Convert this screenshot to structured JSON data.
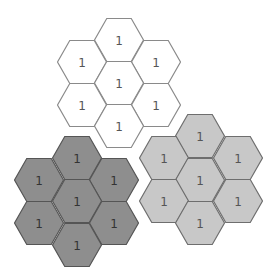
{
  "canvas": {
    "width": 278,
    "height": 278,
    "background": "#ffffff"
  },
  "hex": {
    "side": 24.5,
    "height": 43,
    "orientation": "flat-top"
  },
  "clusters": [
    {
      "name": "white-cluster",
      "fill": "#ffffff",
      "stroke": "#8a8a8a",
      "text_color": "#555555",
      "cells": [
        {
          "position": "top",
          "cx": 119,
          "cy": 40,
          "label": "1"
        },
        {
          "position": "upper-left",
          "cx": 82,
          "cy": 62,
          "label": "1"
        },
        {
          "position": "upper-right",
          "cx": 156,
          "cy": 62,
          "label": "1"
        },
        {
          "position": "center",
          "cx": 119,
          "cy": 83,
          "label": "1"
        },
        {
          "position": "lower-left",
          "cx": 82,
          "cy": 105,
          "label": "1"
        },
        {
          "position": "lower-right",
          "cx": 156,
          "cy": 105,
          "label": "1"
        },
        {
          "position": "bottom",
          "cx": 119,
          "cy": 126,
          "label": "1"
        }
      ]
    },
    {
      "name": "dark-gray-cluster",
      "fill": "#8e8e8e",
      "stroke": "#555555",
      "text_color": "#333333",
      "cells": [
        {
          "position": "top",
          "cx": 77,
          "cy": 158,
          "label": "1"
        },
        {
          "position": "upper-left",
          "cx": 39,
          "cy": 180,
          "label": "1"
        },
        {
          "position": "upper-right",
          "cx": 114,
          "cy": 180,
          "label": "1"
        },
        {
          "position": "center",
          "cx": 77,
          "cy": 201,
          "label": "1"
        },
        {
          "position": "lower-left",
          "cx": 39,
          "cy": 223,
          "label": "1"
        },
        {
          "position": "lower-right",
          "cx": 114,
          "cy": 223,
          "label": "1"
        },
        {
          "position": "bottom",
          "cx": 77,
          "cy": 245,
          "label": "1"
        }
      ]
    },
    {
      "name": "light-gray-cluster",
      "fill": "#c8c8c8",
      "stroke": "#6e6e6e",
      "text_color": "#555555",
      "cells": [
        {
          "position": "top",
          "cx": 200,
          "cy": 136,
          "label": "1"
        },
        {
          "position": "upper-left",
          "cx": 164,
          "cy": 158,
          "label": "1"
        },
        {
          "position": "upper-right",
          "cx": 238,
          "cy": 158,
          "label": "1"
        },
        {
          "position": "center",
          "cx": 200,
          "cy": 180,
          "label": "1"
        },
        {
          "position": "lower-left",
          "cx": 164,
          "cy": 201,
          "label": "1"
        },
        {
          "position": "lower-right",
          "cx": 238,
          "cy": 201,
          "label": "1"
        },
        {
          "position": "bottom",
          "cx": 200,
          "cy": 223,
          "label": "1"
        }
      ]
    }
  ]
}
